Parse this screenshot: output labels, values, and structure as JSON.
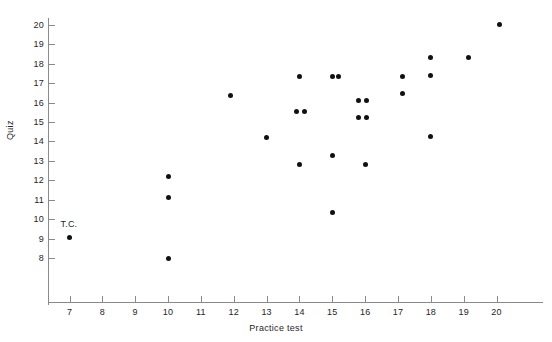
{
  "chart_data": {
    "type": "scatter",
    "title": "",
    "xlabel": "Practice test",
    "ylabel": "Quiz",
    "xlim": [
      6.3,
      21.4
    ],
    "ylim": [
      7.3,
      20.6
    ],
    "grid": false,
    "legend": false,
    "x_ticks": [
      7,
      8,
      9,
      10,
      11,
      12,
      13,
      14,
      15,
      16,
      17,
      18,
      19,
      20
    ],
    "y_ticks": [
      8,
      9,
      10,
      11,
      12,
      13,
      14,
      15,
      16,
      17,
      18,
      19,
      20
    ],
    "x_tick_labels": [
      "7",
      "8",
      "9",
      "10",
      "11",
      "12",
      "13",
      "14",
      "15",
      "16",
      "17",
      "18",
      "19",
      "20"
    ],
    "y_tick_labels": [
      "8",
      "9",
      "10",
      "11",
      "12",
      "13",
      "14",
      "15",
      "16",
      "17",
      "18",
      "19",
      "20"
    ],
    "points": [
      {
        "x": 7.0,
        "y": 9.05,
        "label": "T.C."
      },
      {
        "x": 10.0,
        "y": 12.2,
        "label": ""
      },
      {
        "x": 10.0,
        "y": 11.1,
        "label": ""
      },
      {
        "x": 10.0,
        "y": 8.0,
        "label": ""
      },
      {
        "x": 11.9,
        "y": 16.35,
        "label": ""
      },
      {
        "x": 13.0,
        "y": 14.2,
        "label": ""
      },
      {
        "x": 13.9,
        "y": 15.55,
        "label": ""
      },
      {
        "x": 14.15,
        "y": 15.55,
        "label": ""
      },
      {
        "x": 14.0,
        "y": 17.35,
        "label": ""
      },
      {
        "x": 14.0,
        "y": 12.8,
        "label": ""
      },
      {
        "x": 15.0,
        "y": 17.35,
        "label": ""
      },
      {
        "x": 15.2,
        "y": 17.35,
        "label": ""
      },
      {
        "x": 15.0,
        "y": 13.3,
        "label": ""
      },
      {
        "x": 15.0,
        "y": 10.35,
        "label": ""
      },
      {
        "x": 15.8,
        "y": 16.1,
        "label": ""
      },
      {
        "x": 16.05,
        "y": 16.1,
        "label": ""
      },
      {
        "x": 15.8,
        "y": 15.25,
        "label": ""
      },
      {
        "x": 16.05,
        "y": 15.25,
        "label": ""
      },
      {
        "x": 16.0,
        "y": 12.8,
        "label": ""
      },
      {
        "x": 17.15,
        "y": 17.35,
        "label": ""
      },
      {
        "x": 17.15,
        "y": 16.45,
        "label": ""
      },
      {
        "x": 18.0,
        "y": 18.35,
        "label": ""
      },
      {
        "x": 18.0,
        "y": 17.4,
        "label": ""
      },
      {
        "x": 18.0,
        "y": 14.25,
        "label": ""
      },
      {
        "x": 19.15,
        "y": 18.35,
        "label": ""
      },
      {
        "x": 20.1,
        "y": 20.0,
        "label": ""
      }
    ],
    "annotations": [
      {
        "text": "T.C.",
        "x": 7.0,
        "y": 9.05,
        "dx": 0,
        "dy": -14
      }
    ],
    "marker_color": "#111111",
    "axis_color": "#8a8a8a"
  }
}
